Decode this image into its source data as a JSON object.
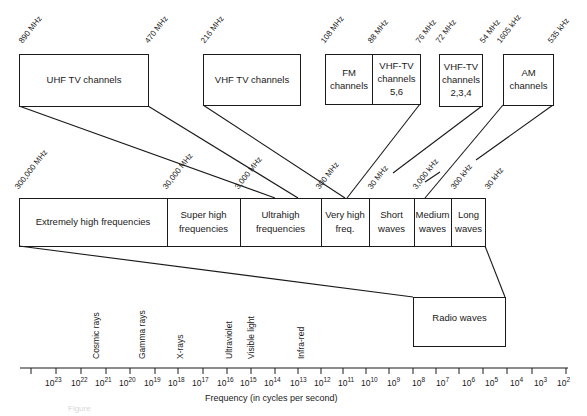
{
  "top_boxes": [
    {
      "id": "uhf",
      "label": "UHF TV channels",
      "freq_high": "890 MHz",
      "freq_low": "470 MHz"
    },
    {
      "id": "vhf",
      "label": "VHF TV channels",
      "freq_high": "216 MHz"
    },
    {
      "id": "fm",
      "label_line1": "FM",
      "label_line2": "channels",
      "freq_high": "108 MHz",
      "freq_low": "88 MHz"
    },
    {
      "id": "vhf56",
      "label_line1": "VHF-TV",
      "label_line2": "channels",
      "label_line3": "5,6",
      "freq_low": "76 MHz"
    },
    {
      "id": "vhf234",
      "label_line1": "VHF-TV",
      "label_line2": "channels",
      "label_line3": "2,3,4",
      "freq_high": "72 MHz",
      "freq_low": "54 MHz"
    },
    {
      "id": "am",
      "label_line1": "AM",
      "label_line2": "channels",
      "freq_high": "1605 kHz",
      "freq_low": "535 kHz"
    }
  ],
  "band": {
    "boundary_labels": [
      "300,000 MHz",
      "30,000 MHz",
      "3,000 MHz",
      "300 MHz",
      "30 MHz",
      "3,000 kHz",
      "300 kHz",
      "30 kHz"
    ],
    "segments": [
      {
        "line1": "Extremely high frequencies",
        "line2": ""
      },
      {
        "line1": "Super high",
        "line2": "frequencies"
      },
      {
        "line1": "Ultrahigh",
        "line2": "frequencies"
      },
      {
        "line1": "Very high",
        "line2": "freq."
      },
      {
        "line1": "Short",
        "line2": "waves"
      },
      {
        "line1": "Medium",
        "line2": "waves"
      },
      {
        "line1": "Long",
        "line2": "waves"
      }
    ]
  },
  "radio_box": {
    "label": "Radio waves"
  },
  "spectrum_labels": [
    "Cosmic rays",
    "Gamma rays",
    "X-rays",
    "Ultraviolet",
    "Visible light",
    "Infra-red"
  ],
  "axis": {
    "tick_exponents": [
      "23",
      "22",
      "21",
      "20",
      "19",
      "18",
      "17",
      "16",
      "15",
      "14",
      "13",
      "12",
      "11",
      "10",
      "9",
      "8",
      "7",
      "6",
      "5",
      "4",
      "3",
      "2"
    ],
    "base": "10",
    "xlabel": "Frequency (in cycles per second)"
  },
  "caption": "Figure"
}
